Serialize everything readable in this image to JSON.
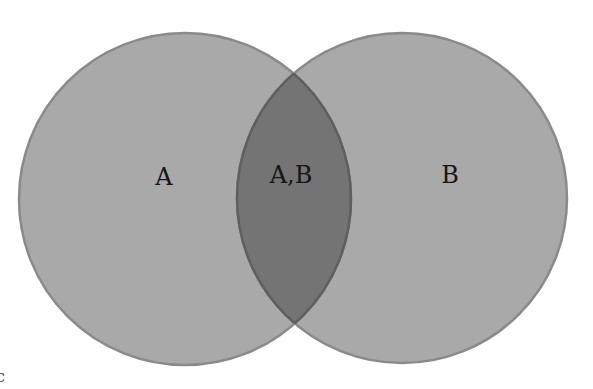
{
  "diagram": {
    "type": "venn",
    "sets": [
      {
        "id": "A",
        "label": "A",
        "cx": 185,
        "cy": 199,
        "r": 166,
        "fill": "#a9a9a9",
        "stroke": "#8a8a8a"
      },
      {
        "id": "B",
        "label": "B",
        "cx": 402,
        "cy": 198,
        "r": 165,
        "fill": "#a9a9a9",
        "stroke": "#8a8a8a"
      }
    ],
    "intersection": {
      "label": "A,B",
      "fill": "#737373"
    },
    "labels": {
      "a": "A",
      "b": "B",
      "ab": "A,B"
    },
    "corner_glyph": "c"
  }
}
